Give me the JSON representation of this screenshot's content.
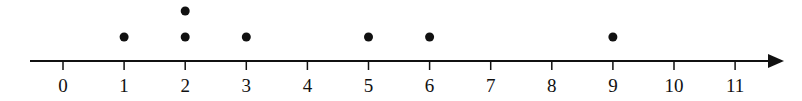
{
  "chart_data": {
    "type": "dot",
    "title": "",
    "xlabel": "",
    "ylabel": "",
    "categories": [
      "0",
      "1",
      "2",
      "3",
      "4",
      "5",
      "6",
      "7",
      "8",
      "9",
      "10",
      "11"
    ],
    "x": [
      0,
      1,
      2,
      3,
      4,
      5,
      6,
      7,
      8,
      9,
      10,
      11
    ],
    "counts": [
      0,
      1,
      2,
      1,
      0,
      1,
      1,
      0,
      0,
      1,
      0,
      0
    ],
    "points": [
      1,
      2,
      2,
      3,
      5,
      6,
      9
    ],
    "xlim": [
      0,
      11
    ],
    "grid": false,
    "legend": null,
    "axis_arrow": "right",
    "colors": {
      "dot": "#111111",
      "axis": "#111111"
    }
  }
}
